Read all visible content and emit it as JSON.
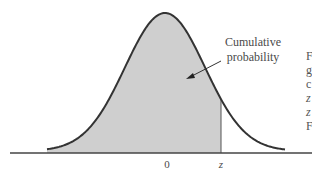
{
  "chart_data": {
    "type": "area",
    "title": "",
    "distribution": "standard normal",
    "x_ticks": [
      {
        "value": 0,
        "label": "0"
      },
      {
        "value": 1.0,
        "label": "z"
      }
    ],
    "shaded_region": {
      "from": "-inf",
      "to": "z"
    },
    "annotations": [
      {
        "text_lines": [
          "Cumulative",
          "probability"
        ],
        "points_to": "shaded area"
      }
    ],
    "xlim": [
      -3.2,
      3.2
    ],
    "grid": false,
    "legend": null
  },
  "labels": {
    "mean": "0",
    "z": "z",
    "annotation_line1": "Cumulative",
    "annotation_line2": "probability"
  },
  "side_text_fragments": [
    "F",
    "g",
    "c",
    "z",
    "z",
    "F"
  ],
  "colors": {
    "curve": "#333333",
    "fill": "#cfcfcf",
    "axis": "#444444"
  }
}
